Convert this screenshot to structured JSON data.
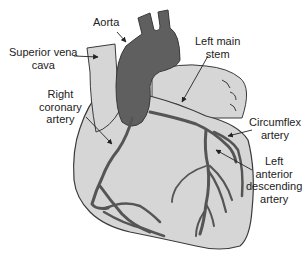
{
  "diagram": {
    "colors": {
      "heart_fill": "#d6d6d6",
      "aorta_fill": "#5f5f5f",
      "vessel_fill": "#6e6e6e",
      "outline": "#3a3a3a",
      "text": "#222222",
      "background": "#ffffff"
    },
    "labels": {
      "aorta": "Aorta",
      "superior_vena_cava": "Superior vena\ncava",
      "right_coronary_artery": "Right\ncoronary\nartery",
      "left_main_stem": "Left main\nstem",
      "circumflex_artery": "Circumflex\nartery",
      "left_anterior_descending_artery": "Left\nanterior\ndescending\nartery"
    }
  }
}
